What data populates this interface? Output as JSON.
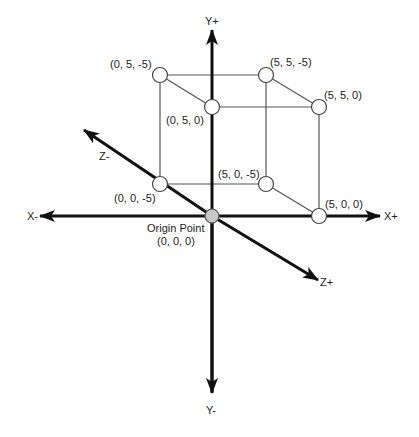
{
  "diagram": {
    "colors": {
      "axis": "#111111",
      "edge": "#555555",
      "vertex_fill": "#ffffff",
      "origin_fill": "#c8c8c8",
      "text": "#222222"
    },
    "axes": {
      "x_pos": "X+",
      "x_neg": "X-",
      "y_pos": "Y+",
      "y_neg": "Y-",
      "z_pos": "Z+",
      "z_neg": "Z-"
    },
    "origin": {
      "label": "Origin Point",
      "coords": "(0, 0, 0)"
    },
    "vertices": [
      {
        "id": "v_0_5_m5",
        "label": "(0, 5, -5)"
      },
      {
        "id": "v_5_5_m5",
        "label": "(5, 5, -5)"
      },
      {
        "id": "v_0_5_0",
        "label": "(0, 5, 0)"
      },
      {
        "id": "v_5_5_0",
        "label": "(5, 5, 0)"
      },
      {
        "id": "v_0_0_m5",
        "label": "(0, 0, -5)"
      },
      {
        "id": "v_5_0_m5",
        "label": "(5, 0, -5)"
      },
      {
        "id": "v_5_0_0",
        "label": "(5, 0, 0)"
      }
    ]
  }
}
